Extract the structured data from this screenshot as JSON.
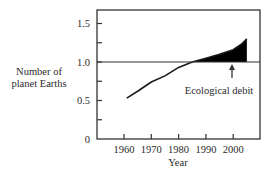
{
  "chart_data": {
    "type": "area",
    "title": "",
    "xlabel": "Year",
    "ylabel": "Number of planet Earths",
    "ylabel_lines": [
      "Number of",
      "planet Earths"
    ],
    "xlim": [
      1955,
      2010
    ],
    "ylim": [
      0,
      1.65
    ],
    "x_ticks": [
      1960,
      1970,
      1980,
      1990,
      2000
    ],
    "x_tick_labels": [
      "1960",
      "1970",
      "1980",
      "1990",
      "2000"
    ],
    "y_ticks": [
      0,
      0.25,
      0.5,
      0.75,
      1.0,
      1.25,
      1.5
    ],
    "y_tick_labels": [
      "0",
      "",
      "0.5",
      "",
      "1.0",
      "",
      "1.5"
    ],
    "grid": false,
    "reference_line": {
      "y": 1.0,
      "label": "1 planet Earth"
    },
    "series": [
      {
        "name": "Humanity's ecological footprint",
        "x": [
          1961,
          1965,
          1970,
          1975,
          1980,
          1985,
          1990,
          1995,
          2000,
          2003,
          2005
        ],
        "values": [
          0.53,
          0.62,
          0.74,
          0.82,
          0.93,
          1.0,
          1.05,
          1.1,
          1.16,
          1.23,
          1.3
        ]
      }
    ],
    "shaded_region": {
      "description": "Area between curve and 1.0 line where footprint exceeds 1",
      "color": "#000000"
    },
    "annotations": [
      {
        "text": "Ecological debit",
        "arrow_to_year": 2000,
        "arrow_to_value": 1.0
      }
    ]
  },
  "colors": {
    "line": "#1a1a1a",
    "fill": "#000000",
    "axis": "#333333"
  }
}
